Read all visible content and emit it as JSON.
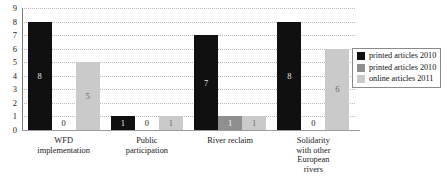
{
  "chart_data": {
    "type": "bar",
    "title": "",
    "subtitle": "",
    "xlabel": "",
    "ylabel": "",
    "ylim": [
      0,
      9
    ],
    "grid": true,
    "grid_style": "dotted horizontal",
    "legend_position": "right",
    "orientation": "vertical grouped",
    "categories": [
      "WFD\nimplementation",
      "Public\nparticipation",
      "River reclaim",
      "Solidarity\nwith other\nEuropean\nrivers"
    ],
    "yticks": [
      "0",
      "1",
      "2",
      "3",
      "4",
      "5",
      "6",
      "7",
      "8",
      "9"
    ],
    "series": [
      {
        "name": "printed articles 2010",
        "color": "#101010",
        "values": [
          8,
          1,
          7,
          8
        ],
        "labels": [
          "8",
          "1",
          "7",
          "8"
        ]
      },
      {
        "name": "printed articles 2010",
        "color": "#8f8f8f",
        "values": [
          0,
          0,
          1,
          0
        ],
        "labels": [
          "0",
          "0",
          "1",
          "0"
        ]
      },
      {
        "name": "online articles 2011",
        "color": "#cacaca",
        "values": [
          5,
          1,
          1,
          6
        ],
        "labels": [
          "5",
          "1",
          "1",
          "6"
        ]
      }
    ]
  },
  "categories_display": [
    {
      "line1": "WFD",
      "line2": "implementation",
      "line3": "",
      "line4": ""
    },
    {
      "line1": "Public",
      "line2": "participation",
      "line3": "",
      "line4": ""
    },
    {
      "line1": "River reclaim",
      "line2": "",
      "line3": "",
      "line4": ""
    },
    {
      "line1": "Solidarity",
      "line2": "with other",
      "line3": "European",
      "line4": "rivers"
    }
  ],
  "legend": {
    "entries": [
      {
        "label": "printed articles 2010",
        "color": "#101010"
      },
      {
        "label": "printed articles 2010",
        "color": "#8f8f8f"
      },
      {
        "label": "online articles 2011",
        "color": "#cacaca"
      }
    ]
  },
  "axis": {
    "y_max_label": "9",
    "y_min_label": "0"
  }
}
